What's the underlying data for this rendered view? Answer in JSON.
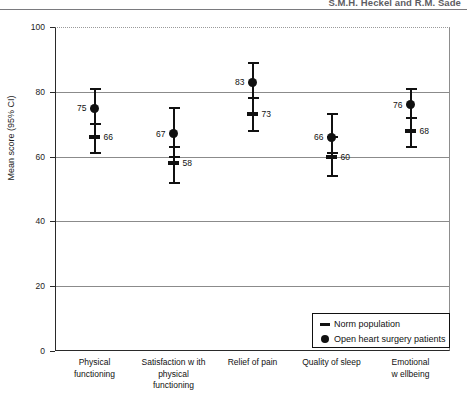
{
  "header": {
    "running_head": "S.M.H. Heckel and R.M. Sade"
  },
  "chart_data": {
    "type": "scatter",
    "title": "",
    "xlabel": "",
    "ylabel": "Mean score (95% CI)",
    "ylim": [
      0,
      100
    ],
    "yticks": [
      0,
      20,
      40,
      60,
      80,
      100
    ],
    "ytick_labels": [
      "0",
      "20",
      "40",
      "60",
      "80",
      "100"
    ],
    "grid": "horizontal",
    "legend_position": "bottom-right",
    "categories": [
      "Physical functioning",
      "Satisfaction w ith physical functioning",
      "Relief of pain",
      "Quality of sleep",
      "Emotional w ellbeing"
    ],
    "category_lines": [
      [
        "Physical",
        "functioning"
      ],
      [
        "Satisfaction w ith",
        "physical",
        "functioning"
      ],
      [
        "Relief of pain"
      ],
      [
        "Quality of sleep"
      ],
      [
        "Emotional",
        "w ellbeing"
      ]
    ],
    "series": [
      {
        "name": "Open heart surgery patients",
        "marker": "dot",
        "values": [
          75,
          67,
          83,
          66,
          76
        ],
        "ci_low": [
          70,
          60,
          78,
          61,
          72
        ],
        "ci_high": [
          81,
          75,
          89,
          73,
          81
        ],
        "label_side": [
          "left",
          "left",
          "left",
          "left",
          "left"
        ]
      },
      {
        "name": "Norm population",
        "marker": "dash",
        "values": [
          66,
          58,
          73,
          60,
          68
        ],
        "ci_low": [
          61,
          52,
          68,
          54,
          63
        ],
        "ci_high": [
          70,
          63,
          78,
          66,
          72
        ],
        "label_side": [
          "right",
          "right",
          "right",
          "right",
          "right"
        ]
      }
    ]
  },
  "legend": {
    "entries": [
      {
        "label": "Norm population",
        "marker": "dash"
      },
      {
        "label": "Open heart surgery patients",
        "marker": "dot"
      }
    ]
  }
}
